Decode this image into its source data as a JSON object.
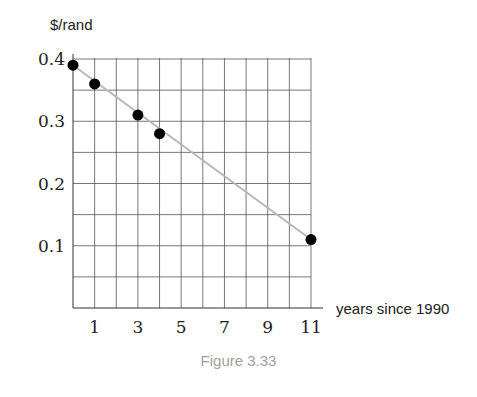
{
  "chart_data": {
    "type": "scatter",
    "title": "",
    "xlabel": "years since 1990",
    "ylabel": "$/rand",
    "x": [
      0,
      1,
      3,
      4,
      11
    ],
    "series": [
      {
        "name": "exchange rate",
        "values": [
          0.39,
          0.36,
          0.31,
          0.28,
          0.11
        ]
      }
    ],
    "trend_line": {
      "x": [
        0,
        11
      ],
      "y": [
        0.39,
        0.11
      ],
      "color": "#b8b8b8"
    },
    "x_ticks": [
      1,
      3,
      5,
      7,
      9,
      11
    ],
    "y_ticks": [
      0.1,
      0.2,
      0.3,
      0.4
    ],
    "y_tick_labels": [
      "0.1",
      "0.2",
      "0.3",
      "0.4"
    ],
    "xlim": [
      0,
      11
    ],
    "ylim": [
      0,
      0.4
    ],
    "grid": {
      "on": true,
      "x_step": 1,
      "y_step": 0.05
    },
    "legend": null,
    "point_color": "#000000",
    "grid_color": "#555555"
  },
  "caption": "Figure 3.33"
}
